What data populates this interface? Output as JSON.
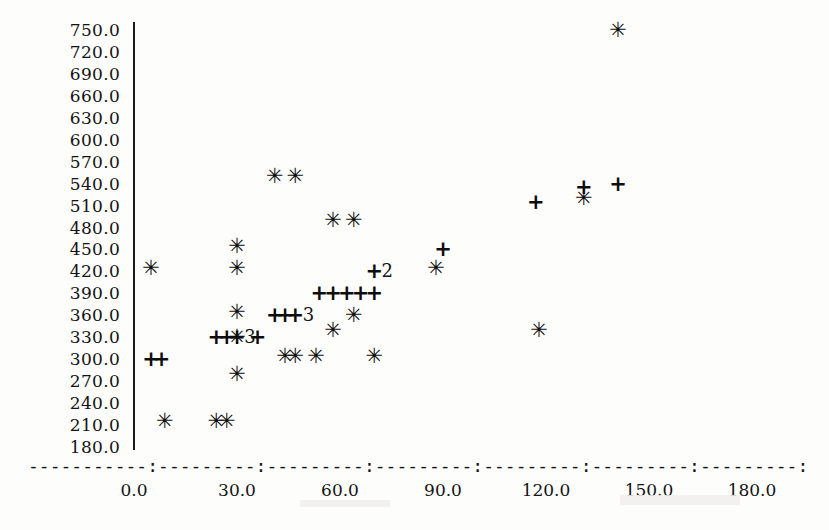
{
  "chart_data": {
    "type": "scatter",
    "title": "",
    "xlabel": "",
    "ylabel": "",
    "xlim": [
      -5,
      190
    ],
    "ylim": [
      180,
      760
    ],
    "grid": false,
    "legend_position": "none",
    "x_ticks": [
      "0.0",
      "30.0",
      "60.0",
      "90.0",
      "120.0",
      "150.0",
      "180.0"
    ],
    "x_tick_values": [
      0,
      30,
      60,
      90,
      120,
      150,
      180
    ],
    "y_ticks": [
      "750.0",
      "720.0",
      "690.0",
      "660.0",
      "630.0",
      "600.0",
      "570.0",
      "540.0",
      "510.0",
      "480.0",
      "450.0",
      "420.0",
      "390.0",
      "360.0",
      "330.0",
      "300.0",
      "270.0",
      "240.0",
      "210.0",
      "180.0"
    ],
    "y_tick_values": [
      750,
      720,
      690,
      660,
      630,
      600,
      570,
      540,
      510,
      480,
      450,
      420,
      390,
      360,
      330,
      300,
      270,
      240,
      210,
      180
    ],
    "marker_symbols": {
      "star": "*",
      "plus": "+"
    },
    "series": [
      {
        "name": "star",
        "symbol": "*",
        "points": [
          {
            "x": 5,
            "y": 425
          },
          {
            "x": 9,
            "y": 215
          },
          {
            "x": 24,
            "y": 215
          },
          {
            "x": 27,
            "y": 215
          },
          {
            "x": 30,
            "y": 455
          },
          {
            "x": 30,
            "y": 425
          },
          {
            "x": 30,
            "y": 365
          },
          {
            "x": 30,
            "y": 330
          },
          {
            "x": 30,
            "y": 280
          },
          {
            "x": 41,
            "y": 550
          },
          {
            "x": 47,
            "y": 550
          },
          {
            "x": 44,
            "y": 305
          },
          {
            "x": 47,
            "y": 305
          },
          {
            "x": 53,
            "y": 305
          },
          {
            "x": 58,
            "y": 490
          },
          {
            "x": 58,
            "y": 340
          },
          {
            "x": 64,
            "y": 490
          },
          {
            "x": 64,
            "y": 360
          },
          {
            "x": 70,
            "y": 305
          },
          {
            "x": 88,
            "y": 425
          },
          {
            "x": 118,
            "y": 340
          },
          {
            "x": 131,
            "y": 520
          },
          {
            "x": 141,
            "y": 750
          }
        ]
      },
      {
        "name": "plus",
        "symbol": "+",
        "points": [
          {
            "x": 5,
            "y": 300
          },
          {
            "x": 8,
            "y": 300
          },
          {
            "x": 24,
            "y": 330
          },
          {
            "x": 27,
            "y": 330
          },
          {
            "x": 30,
            "y": 330
          },
          {
            "x": 36,
            "y": 330
          },
          {
            "x": 41,
            "y": 360
          },
          {
            "x": 44,
            "y": 360
          },
          {
            "x": 47,
            "y": 360
          },
          {
            "x": 54,
            "y": 390
          },
          {
            "x": 58,
            "y": 390
          },
          {
            "x": 62,
            "y": 390
          },
          {
            "x": 66,
            "y": 390
          },
          {
            "x": 70,
            "y": 390
          },
          {
            "x": 70,
            "y": 420
          },
          {
            "x": 90,
            "y": 450
          },
          {
            "x": 117,
            "y": 515
          },
          {
            "x": 131,
            "y": 535
          },
          {
            "x": 141,
            "y": 540
          }
        ]
      }
    ],
    "overplot_labels": [
      {
        "x": 30,
        "y": 330,
        "count": "3",
        "note": "three coincident plus markers"
      },
      {
        "x": 47,
        "y": 360,
        "count": "3",
        "note": "three coincident plus markers"
      },
      {
        "x": 70,
        "y": 420,
        "count": "2",
        "note": "two coincident plus markers"
      }
    ],
    "axis_dash_row": "-----------:---------:---------:---------:---------:---------:---------:"
  },
  "markers": {
    "star_glyph": "✳",
    "plus_glyph": "+"
  }
}
